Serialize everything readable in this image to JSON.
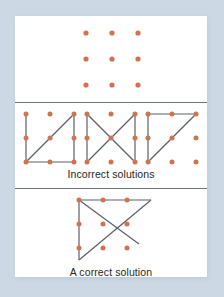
{
  "figure": {
    "background_color": "#ccd9e4",
    "card_color": "#ffffff",
    "dot_color": "#d4714e",
    "line_color": "#5a6068",
    "divider_color": "#6e747b",
    "text_color": "#231f20"
  },
  "captions": {
    "incorrect": "Incorrect solutions",
    "correct": "A correct solution"
  },
  "panels": [
    {
      "id": "puzzle-grid",
      "caption": "",
      "figures": [
        {
          "id": "nine-dot-grid",
          "dots": [
            [
              0,
              0
            ],
            [
              1,
              0
            ],
            [
              2,
              0
            ],
            [
              0,
              1
            ],
            [
              1,
              1
            ],
            [
              2,
              1
            ],
            [
              0,
              2
            ],
            [
              1,
              2
            ],
            [
              2,
              2
            ]
          ],
          "lines": []
        }
      ]
    },
    {
      "id": "incorrect-solutions",
      "caption": "Incorrect solutions",
      "figures": [
        {
          "id": "incorrect-1",
          "dots": [
            [
              0,
              0
            ],
            [
              1,
              0
            ],
            [
              2,
              0
            ],
            [
              0,
              1
            ],
            [
              1,
              1
            ],
            [
              2,
              1
            ],
            [
              0,
              2
            ],
            [
              1,
              2
            ],
            [
              2,
              2
            ]
          ],
          "lines": [
            [
              [
                0,
                0
              ],
              [
                0,
                2
              ]
            ],
            [
              [
                0,
                2
              ],
              [
                2,
                2
              ]
            ],
            [
              [
                2,
                2
              ],
              [
                2,
                0
              ]
            ],
            [
              [
                0,
                2
              ],
              [
                2,
                0
              ]
            ]
          ]
        },
        {
          "id": "incorrect-2",
          "dots": [
            [
              0,
              0
            ],
            [
              1,
              0
            ],
            [
              2,
              0
            ],
            [
              0,
              1
            ],
            [
              1,
              1
            ],
            [
              2,
              1
            ],
            [
              0,
              2
            ],
            [
              1,
              2
            ],
            [
              2,
              2
            ]
          ],
          "lines": [
            [
              [
                0,
                0
              ],
              [
                0,
                2
              ]
            ],
            [
              [
                0,
                0
              ],
              [
                2,
                2
              ]
            ],
            [
              [
                2,
                0
              ],
              [
                0,
                2
              ]
            ],
            [
              [
                2,
                0
              ],
              [
                2,
                2
              ]
            ]
          ]
        },
        {
          "id": "incorrect-3",
          "dots": [
            [
              0,
              0
            ],
            [
              1,
              0
            ],
            [
              2,
              0
            ],
            [
              0,
              1
            ],
            [
              1,
              1
            ],
            [
              2,
              1
            ],
            [
              0,
              2
            ],
            [
              1,
              2
            ],
            [
              2,
              2
            ]
          ],
          "lines": [
            [
              [
                0,
                0
              ],
              [
                2,
                0
              ]
            ],
            [
              [
                0,
                0
              ],
              [
                0,
                2
              ]
            ],
            [
              [
                0,
                2
              ],
              [
                2,
                0
              ]
            ]
          ]
        }
      ]
    },
    {
      "id": "correct-solution",
      "caption": "A correct solution",
      "figures": [
        {
          "id": "correct-1",
          "dots": [
            [
              0,
              0
            ],
            [
              1,
              0
            ],
            [
              2,
              0
            ],
            [
              0,
              1
            ],
            [
              1,
              1
            ],
            [
              2,
              1
            ],
            [
              0,
              2
            ],
            [
              1,
              2
            ],
            [
              2,
              2
            ]
          ],
          "lines": [
            [
              [
                0,
                0
              ],
              [
                3,
                0
              ]
            ],
            [
              [
                3,
                0
              ],
              [
                0,
                3
              ]
            ],
            [
              [
                0,
                3
              ],
              [
                0,
                0
              ]
            ],
            [
              [
                0,
                0
              ],
              [
                2.6,
                2.6
              ]
            ]
          ]
        }
      ]
    }
  ]
}
